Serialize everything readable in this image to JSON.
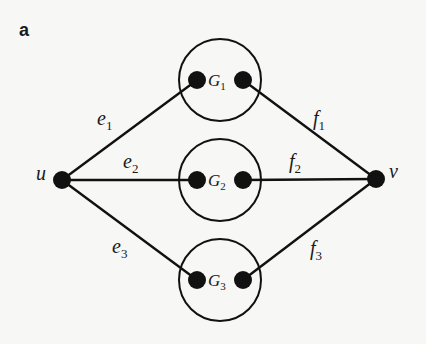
{
  "panel_label": "a",
  "colors": {
    "ink": "#111111",
    "background": "#f7f7f5"
  },
  "nodes": {
    "u": {
      "label": "u",
      "x": 62,
      "y": 180
    },
    "v": {
      "label": "v",
      "x": 376,
      "y": 179
    }
  },
  "subgraphs": [
    {
      "name": "G",
      "sub": "1",
      "cx": 220,
      "cy": 80,
      "r": 41,
      "left_dot": [
        197,
        80
      ],
      "right_dot": [
        243,
        80
      ]
    },
    {
      "name": "G",
      "sub": "2",
      "cx": 220,
      "cy": 180,
      "r": 41,
      "left_dot": [
        197,
        180
      ],
      "right_dot": [
        243,
        180
      ]
    },
    {
      "name": "G",
      "sub": "3",
      "cx": 220,
      "cy": 280,
      "r": 41,
      "left_dot": [
        197,
        280
      ],
      "right_dot": [
        243,
        280
      ]
    }
  ],
  "edges": [
    {
      "name": "e",
      "sub": "1",
      "from": "u",
      "to": "G1-left",
      "label_x": 97,
      "label_y": 127
    },
    {
      "name": "e",
      "sub": "2",
      "from": "u",
      "to": "G2-left",
      "label_x": 123,
      "label_y": 170
    },
    {
      "name": "e",
      "sub": "3",
      "from": "u",
      "to": "G3-left",
      "label_x": 112,
      "label_y": 255
    },
    {
      "name": "f",
      "sub": "1",
      "from": "G1-right",
      "to": "v",
      "label_x": 313,
      "label_y": 127
    },
    {
      "name": "f",
      "sub": "2",
      "from": "G2-right",
      "to": "v",
      "label_x": 289,
      "label_y": 170
    },
    {
      "name": "f",
      "sub": "3",
      "from": "G3-right",
      "to": "v",
      "label_x": 310,
      "label_y": 257
    }
  ],
  "labels": {
    "u": "u",
    "v": "v",
    "G1": "G",
    "G1_sub": "1",
    "G2": "G",
    "G2_sub": "2",
    "G3": "G",
    "G3_sub": "3",
    "e1": "e",
    "e1_sub": "1",
    "e2": "e",
    "e2_sub": "2",
    "e3": "e",
    "e3_sub": "3",
    "f1": "f",
    "f1_sub": "1",
    "f2": "f",
    "f2_sub": "2",
    "f3": "f",
    "f3_sub": "3"
  }
}
